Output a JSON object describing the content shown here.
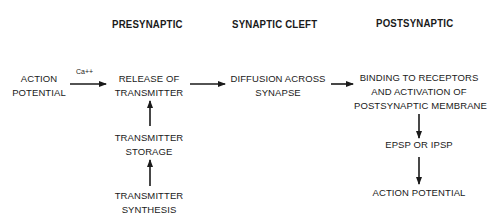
{
  "headers": {
    "presynaptic": "PRESYNAPTIC",
    "cleft": "SYNAPTIC CLEFT",
    "postsynaptic": "POSTSYNAPTIC"
  },
  "nodes": {
    "action_potential_in": [
      "ACTION",
      "POTENTIAL"
    ],
    "release": [
      "RELEASE OF",
      "TRANSMITTER"
    ],
    "storage": [
      "TRANSMITTER",
      "STORAGE"
    ],
    "synthesis": [
      "TRANSMITTER",
      "SYNTHESIS"
    ],
    "diffusion": [
      "DIFFUSION ACROSS",
      "SYNAPSE"
    ],
    "binding": [
      "BINDING TO RECEPTORS",
      "AND ACTIVATION OF",
      "POSTSYNAPTIC MEMBRANE"
    ],
    "epsp": [
      "EPSP OR IPSP"
    ],
    "action_potential_out": [
      "ACTION POTENTIAL"
    ]
  },
  "edges": [
    {
      "from": "action_potential_in",
      "to": "release",
      "label": "Ca++"
    },
    {
      "from": "synthesis",
      "to": "storage",
      "label": ""
    },
    {
      "from": "storage",
      "to": "release",
      "label": ""
    },
    {
      "from": "release",
      "to": "diffusion",
      "label": ""
    },
    {
      "from": "diffusion",
      "to": "binding",
      "label": ""
    },
    {
      "from": "binding",
      "to": "epsp",
      "label": ""
    },
    {
      "from": "epsp",
      "to": "action_potential_out",
      "label": ""
    }
  ],
  "edge_labels": {
    "calcium": "Ca++"
  },
  "colors": {
    "ink": "#1a1a1a",
    "background": "#ffffff"
  }
}
